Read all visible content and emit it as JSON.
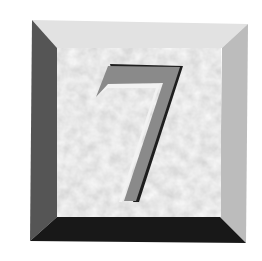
{
  "tile": {
    "numeral": "7",
    "colors": {
      "background": "#ffffff",
      "bevel_top": "#e4e4e4",
      "bevel_left": "#5a5a5a",
      "bevel_right": "#bdbdbd",
      "bevel_bottom": "#1a1a1a",
      "face": "#d2d2d2",
      "numeral_fill": "#8c8c8c",
      "numeral_shadow": "#1e1e1e",
      "numeral_highlight": "#f4f4f4"
    }
  }
}
